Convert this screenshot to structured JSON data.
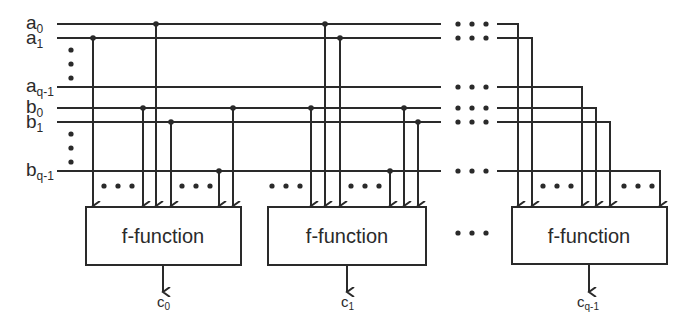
{
  "diagram": {
    "inputs": [
      {
        "name": "a",
        "sub": "0",
        "y": 24
      },
      {
        "name": "a",
        "sub": "1",
        "y": 38
      },
      {
        "name": "a",
        "sub": "q-1",
        "y": 87
      },
      {
        "name": "b",
        "sub": "0",
        "y": 108
      },
      {
        "name": "b",
        "sub": "1",
        "y": 122
      },
      {
        "name": "b",
        "sub": "q-1",
        "y": 171
      }
    ],
    "blocks": [
      {
        "label": "f-function",
        "output_name": "c",
        "output_sub": "0"
      },
      {
        "label": "f-function",
        "output_name": "c",
        "output_sub": "1"
      },
      {
        "label": "f-function",
        "output_name": "c",
        "output_sub": "q-1"
      }
    ],
    "ellipsis": "• • •",
    "colors": {
      "stroke": "#2a2a2a",
      "background": "#ffffff"
    }
  }
}
